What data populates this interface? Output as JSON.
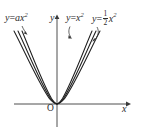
{
  "figure": {
    "type": "math-graph",
    "background_color": "#ffffff",
    "stroke_color": "#2b2b2b",
    "axes": {
      "origin_label": "O",
      "x_axis_label": "x",
      "y_axis_label": "y",
      "origin_px": [
        57,
        104
      ],
      "x_axis_from_px": [
        14,
        104
      ],
      "x_axis_to_px": [
        129,
        104
      ],
      "y_axis_from_px": [
        57,
        127
      ],
      "y_axis_to_px": [
        57,
        17
      ]
    },
    "curve_labels": {
      "left": {
        "lhs": "y",
        "eq": "=",
        "coef": "a",
        "var": "x",
        "exponent": "2"
      },
      "middle": {
        "lhs": "y",
        "eq": "=",
        "var": "x",
        "exponent": "2"
      },
      "right": {
        "lhs": "y",
        "eq": "=",
        "numerator": "1",
        "denominator": "2",
        "var": "x",
        "exponent": "2"
      }
    },
    "curves": [
      {
        "name": "parabola-a",
        "equation": "y = a x^2",
        "width_factor": 1.0
      },
      {
        "name": "parabola-one",
        "equation": "y = x^2",
        "width_factor": 1.16
      },
      {
        "name": "parabola-half",
        "equation": "y = 0.5 x^2",
        "width_factor": 1.34
      }
    ]
  }
}
